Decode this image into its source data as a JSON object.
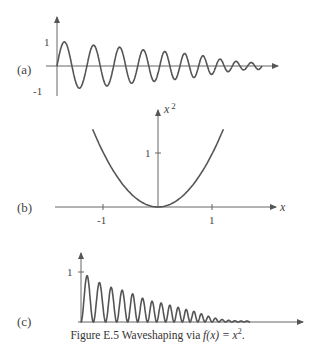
{
  "figure": {
    "caption_prefix": "Figure E.5 Waveshaping via ",
    "caption_math": "f(x) = x",
    "caption_sup": "2",
    "caption_suffix": "."
  },
  "panels": {
    "a": {
      "label": "(a)",
      "ytick_top": "1",
      "ytick_bottom": "-1"
    },
    "b": {
      "label": "(b)",
      "ylabel": "x",
      "ylabel_sup": "2",
      "xlabel": "x",
      "ytick": "1",
      "xtick_neg": "-1",
      "xtick_pos": "1"
    },
    "c": {
      "label": "(c)",
      "ytick": "1"
    }
  },
  "chart_data": [
    {
      "type": "line",
      "title": "(a) Input signal: decaying chirped sinusoid",
      "xlabel": "",
      "ylabel": "",
      "ylim": [
        -1,
        1
      ],
      "yticks": [
        "1",
        "-1"
      ],
      "peak_amplitudes": [
        1.0,
        0.85,
        0.78,
        0.66,
        0.6,
        0.52,
        0.44,
        0.3,
        0.2,
        0.14
      ],
      "cycles": 10,
      "grid": false
    },
    {
      "type": "line",
      "title": "(b) Transfer function x^2",
      "xlabel": "x",
      "ylabel": "x^2",
      "x": [
        -1.2,
        -1,
        -0.5,
        0,
        0.5,
        1,
        1.2
      ],
      "values": [
        1.44,
        1,
        0.25,
        0,
        0.25,
        1,
        1.44
      ],
      "xticks": [
        "-1",
        "1"
      ],
      "yticks": [
        "1"
      ],
      "xlim": [
        -1.4,
        1.8
      ],
      "ylim": [
        0,
        1.6
      ],
      "grid": false
    },
    {
      "type": "line",
      "title": "(c) Output signal: square of (a)",
      "xlabel": "",
      "ylabel": "",
      "ylim": [
        0,
        1
      ],
      "yticks": [
        "1"
      ],
      "peak_values": [
        1.0,
        0.72,
        0.6,
        0.44,
        0.36,
        0.27,
        0.19,
        0.1
      ],
      "grid": false
    }
  ]
}
